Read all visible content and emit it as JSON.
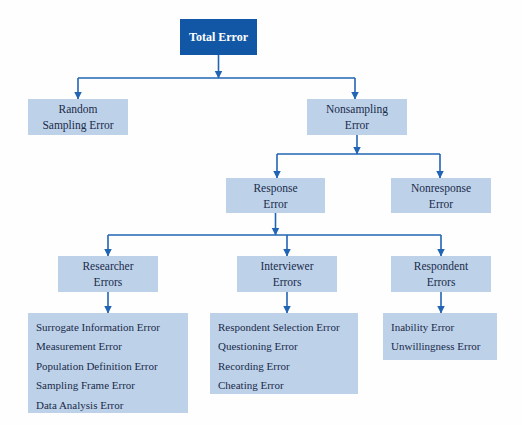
{
  "colors": {
    "canvas_bg": "#fefefe",
    "root_fill": "#1257a6",
    "root_text": "#ffffff",
    "node_fill": "#bdd2e9",
    "node_text": "#1b2a4a",
    "connector": "#2264b4"
  },
  "nodes": {
    "total": {
      "label": "Total Error"
    },
    "random_sampling": {
      "label": "Random\nSampling Error"
    },
    "nonsampling": {
      "label": "Nonsampling\nError"
    },
    "response": {
      "label": "Response\nError"
    },
    "nonresponse": {
      "label": "Nonresponse\nError"
    },
    "researcher": {
      "label": "Researcher\nErrors"
    },
    "interviewer": {
      "label": "Interviewer\nErrors"
    },
    "respondent": {
      "label": "Respondent\nErrors"
    }
  },
  "leaf_lists": {
    "researcher": {
      "items": [
        "Surrogate Information Error",
        "Measurement Error",
        "Population Definition Error",
        "Sampling Frame Error",
        "Data Analysis Error"
      ]
    },
    "interviewer": {
      "items": [
        "Respondent Selection Error",
        "Questioning Error",
        "Recording Error",
        "Cheating Error"
      ]
    },
    "respondent": {
      "items": [
        "Inability Error",
        "Unwillingness Error"
      ]
    }
  }
}
